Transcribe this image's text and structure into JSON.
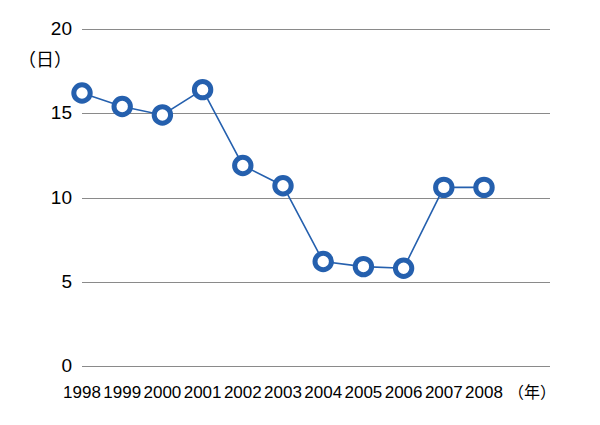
{
  "chart_data": {
    "type": "line",
    "title": "",
    "xlabel": "（年）",
    "ylabel": "（日）",
    "categories": [
      "1998",
      "1999",
      "2000",
      "2001",
      "2002",
      "2003",
      "2004",
      "2005",
      "2006",
      "2007",
      "2008"
    ],
    "values": [
      16.2,
      15.4,
      14.9,
      16.4,
      11.9,
      10.7,
      6.2,
      5.9,
      5.8,
      10.6,
      10.6
    ],
    "series": [
      {
        "name": "",
        "values": [
          16.2,
          15.4,
          14.9,
          16.4,
          11.9,
          10.7,
          6.2,
          5.9,
          5.8,
          10.6,
          10.6
        ]
      }
    ],
    "ylim": [
      0,
      20
    ],
    "yticks": [
      0,
      5,
      10,
      15,
      20
    ],
    "ytick_labels": [
      "0",
      "5",
      "10",
      "15",
      "20"
    ],
    "grid": true,
    "legend": "none",
    "marker": "open-circle",
    "colors": {
      "series_line": "#2560AE",
      "marker_stroke": "#2560AE",
      "marker_fill": "#ffffff",
      "gridline": "#8a8a8a",
      "text": "#000000"
    }
  }
}
